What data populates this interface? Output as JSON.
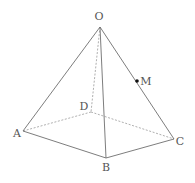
{
  "diagram": {
    "type": "square pyramid (3D wireframe)",
    "colors": {
      "solid_edge": "#6e6e6e",
      "dashed_edge": "#9a9a9a",
      "label": "#555555",
      "point": "#111111"
    },
    "vertices": {
      "O": {
        "label": "O",
        "x": 100,
        "y": 27,
        "lx": 99,
        "ly": 20
      },
      "A": {
        "label": "A",
        "x": 23,
        "y": 131,
        "lx": 17,
        "ly": 137
      },
      "B": {
        "label": "B",
        "x": 106,
        "y": 158,
        "lx": 106,
        "ly": 171
      },
      "C": {
        "label": "C",
        "x": 174,
        "y": 139,
        "lx": 180,
        "ly": 145
      },
      "D": {
        "label": "D",
        "x": 91,
        "y": 112,
        "lx": 84,
        "ly": 110
      }
    },
    "point_M": {
      "label": "M",
      "x": 137,
      "y": 81,
      "lx": 146,
      "ly": 85,
      "on_edge": "OC"
    },
    "solid_edges": [
      "OA",
      "OB",
      "OC",
      "AB",
      "BC"
    ],
    "dashed_edges": [
      "OD",
      "DA",
      "DC"
    ]
  }
}
